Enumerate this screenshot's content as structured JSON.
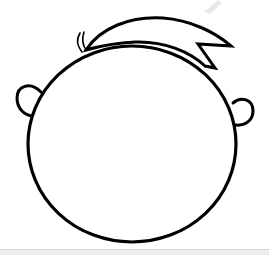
{
  "image": {
    "subject": "cartoon-head-outline",
    "stroke_color": "#000000",
    "background_color": "#ffffff",
    "parts": [
      "head",
      "hair-swoop",
      "hair-strands",
      "left-ear",
      "right-ear"
    ]
  },
  "footer": {
    "bar_color": "#ececec"
  }
}
